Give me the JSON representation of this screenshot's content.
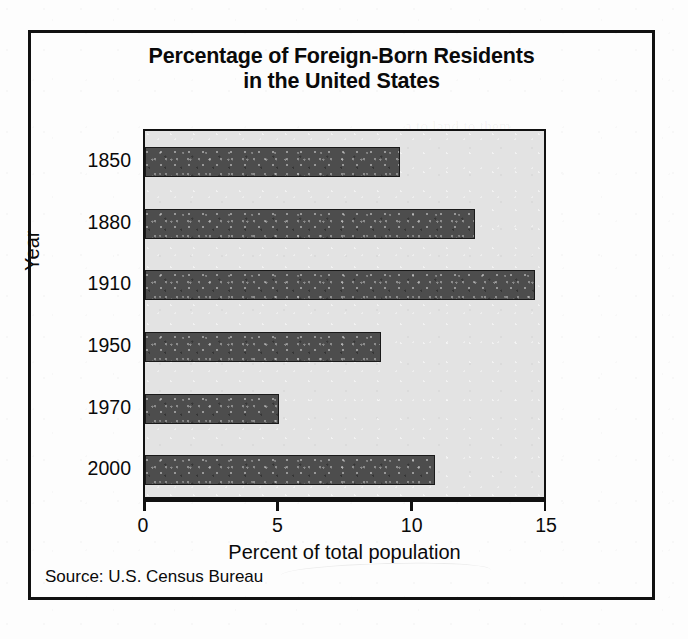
{
  "figure": {
    "title_line1": "Percentage of Foreign-Born Residents",
    "title_line2": "in the United States",
    "source": "Source: U.S. Census Bureau",
    "bar_color": "#4d4d4d",
    "plot_background": "#e3e3e3",
    "border_color": "#111111"
  },
  "background_bleed": [
    {
      "text": "a to land to them",
      "x": 405,
      "y": 118
    },
    {
      "text": "is of the tiny the",
      "x": 412,
      "y": 140
    },
    {
      "text": "of the word was",
      "x": 398,
      "y": 196
    },
    {
      "text": "in the own that",
      "x": 420,
      "y": 232
    },
    {
      "text": "a few the into",
      "x": 402,
      "y": 300
    },
    {
      "text": "now in America",
      "x": 395,
      "y": 344
    },
    {
      "text": "the some sea",
      "x": 414,
      "y": 398
    }
  ],
  "chart_data": {
    "type": "bar",
    "orientation": "horizontal",
    "title": "Percentage of Foreign-Born Residents in the United States",
    "xlabel": "Percent of total population",
    "ylabel": "Year",
    "categories": [
      "1850",
      "1880",
      "1910",
      "1950",
      "1970",
      "2000"
    ],
    "values": [
      9.5,
      12.3,
      14.5,
      8.8,
      5.0,
      10.8
    ],
    "xlim": [
      0,
      15
    ],
    "xticks": [
      0,
      5,
      10,
      15
    ],
    "xtick_labels": [
      "0",
      "5",
      "10",
      "15"
    ],
    "grid": false,
    "legend": null,
    "source": "Source: U.S. Census Bureau"
  }
}
